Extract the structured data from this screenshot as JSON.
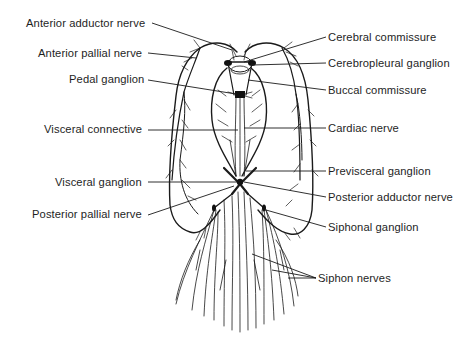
{
  "figure": {
    "labels_left": [
      {
        "id": "anterior-adductor-nerve",
        "text": "Anterior adductor nerve",
        "x": 26,
        "y": 17
      },
      {
        "id": "anterior-pallial-nerve",
        "text": "Anterior pallial nerve",
        "x": 38,
        "y": 47
      },
      {
        "id": "pedal-ganglion",
        "text": "Pedal ganglion",
        "x": 69,
        "y": 73
      },
      {
        "id": "visceral-connective",
        "text": "Visceral connective",
        "x": 44,
        "y": 123
      },
      {
        "id": "visceral-ganglion",
        "text": "Visceral ganglion",
        "x": 55,
        "y": 176
      },
      {
        "id": "posterior-pallial-nerve",
        "text": "Posterior pallial nerve",
        "x": 32,
        "y": 208
      }
    ],
    "labels_right": [
      {
        "id": "cerebral-commissure",
        "text": "Cerebral commissure",
        "x": 328,
        "y": 31
      },
      {
        "id": "cerebropleural-ganglion",
        "text": "Cerebropleural ganglion",
        "x": 328,
        "y": 57
      },
      {
        "id": "buccal-commissure",
        "text": "Buccal commissure",
        "x": 328,
        "y": 84
      },
      {
        "id": "cardiac-nerve",
        "text": "Cardiac nerve",
        "x": 328,
        "y": 122
      },
      {
        "id": "previsceral-ganglion",
        "text": "Previsceral ganglion",
        "x": 328,
        "y": 165
      },
      {
        "id": "posterior-adductor-nerve",
        "text": "Posterior adductor nerve",
        "x": 328,
        "y": 191
      },
      {
        "id": "siphonal-ganglion",
        "text": "Siphonal ganglion",
        "x": 328,
        "y": 221
      },
      {
        "id": "siphon-nerves",
        "text": "Siphon nerves",
        "x": 318,
        "y": 272
      }
    ],
    "colors": {
      "background": "#ffffff",
      "ink": "#1a1a1a"
    }
  }
}
